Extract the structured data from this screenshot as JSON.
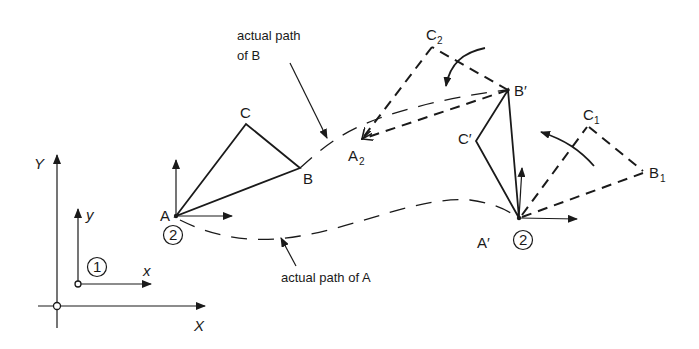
{
  "figure": {
    "type": "rigid-body-motion-diagram",
    "global_frame": {
      "x_label": "X",
      "y_label": "Y"
    },
    "local_frame_1": {
      "x_label": "x",
      "y_label": "y",
      "marker": "1"
    },
    "body_initial": {
      "A": "A",
      "B": "B",
      "C": "C",
      "frame_marker": "2"
    },
    "body_final": {
      "A": "A′",
      "B": "B′",
      "C": "C′",
      "frame_marker": "2"
    },
    "intermediate_1": {
      "B": "B",
      "B_sub": "1",
      "C": "C",
      "C_sub": "1"
    },
    "intermediate_2": {
      "A": "A",
      "A_sub": "2",
      "C": "C",
      "C_sub": "2"
    },
    "annotations": {
      "path_b_line1": "actual path",
      "path_b_line2": "of B",
      "path_a": "actual path of A"
    }
  }
}
